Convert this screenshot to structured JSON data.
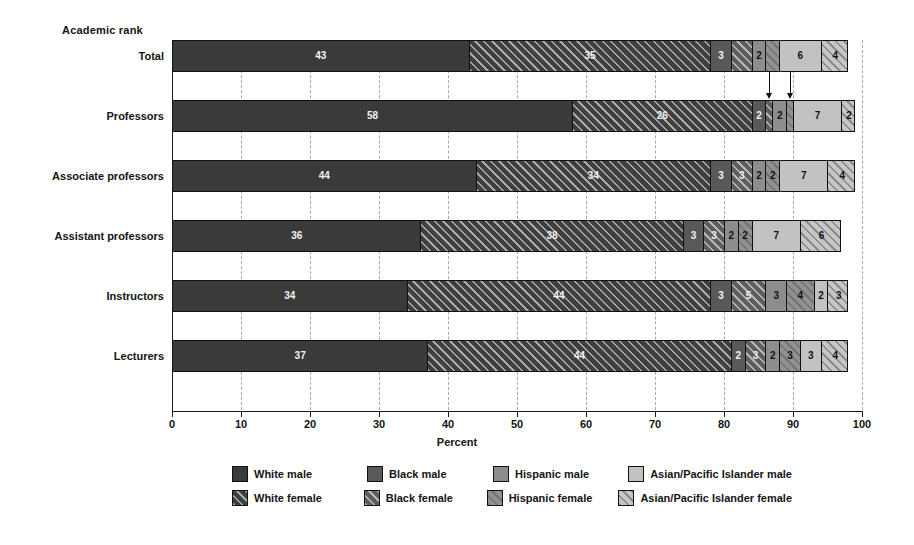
{
  "chart_data": {
    "type": "bar",
    "orientation": "horizontal",
    "stacked": true,
    "stacked_mode": "percent-segments",
    "title": "",
    "group_axis_title": "Academic rank",
    "xlabel": "Percent",
    "ylabel": "",
    "xlim": [
      0,
      100
    ],
    "xticks": [
      0,
      10,
      20,
      30,
      40,
      50,
      60,
      70,
      80,
      90,
      100
    ],
    "xtick_labels": [
      "0",
      "10",
      "20",
      "30",
      "40",
      "50",
      "60",
      "70",
      "80",
      "90",
      "100"
    ],
    "grid": "vertical-dashed",
    "legend_position": "bottom",
    "categories": [
      "Total",
      "Professors",
      "Associate professors",
      "Assistant professors",
      "Instructors",
      "Lecturers"
    ],
    "series": [
      {
        "name": "White male",
        "key": "white-male",
        "fill": "solid",
        "color": "#3a3a3a",
        "values": [
          43,
          58,
          44,
          36,
          34,
          37
        ]
      },
      {
        "name": "White female",
        "key": "white-female",
        "fill": "hatched",
        "color": "#3f3f3f",
        "values": [
          35,
          26,
          34,
          38,
          44,
          44
        ]
      },
      {
        "name": "Black male",
        "key": "black-male",
        "fill": "solid",
        "color": "#595959",
        "values": [
          3,
          2,
          3,
          3,
          3,
          2
        ]
      },
      {
        "name": "Black female",
        "key": "black-female",
        "fill": "hatched",
        "color": "#5e5e5e",
        "values": [
          3,
          1,
          3,
          3,
          5,
          3
        ]
      },
      {
        "name": "Hispanic male",
        "key": "hispanic-male",
        "fill": "solid",
        "color": "#8d8d8d",
        "values": [
          2,
          2,
          2,
          2,
          3,
          2
        ]
      },
      {
        "name": "Hispanic female",
        "key": "hispanic-female",
        "fill": "hatched",
        "color": "#919191",
        "values": [
          2,
          1,
          2,
          2,
          4,
          3
        ]
      },
      {
        "name": "Asian/Pacific Islander male",
        "key": "asian-male",
        "fill": "solid",
        "color": "#c2c2c2",
        "values": [
          6,
          7,
          7,
          7,
          2,
          3
        ]
      },
      {
        "name": "Asian/Pacific Islander female",
        "key": "asian-female",
        "fill": "hatched",
        "color": "#c6c6c6",
        "values": [
          4,
          2,
          4,
          6,
          3,
          4
        ]
      }
    ],
    "segment_labels": {
      "Total": [
        "43",
        "35",
        "3",
        "",
        "2",
        "",
        "6",
        "4"
      ],
      "Professors": [
        "58",
        "26",
        "2",
        "",
        "2",
        "",
        "7",
        "2"
      ],
      "Associate professors": [
        "44",
        "34",
        "3",
        "3",
        "2",
        "2",
        "7",
        "4"
      ],
      "Assistant professors": [
        "36",
        "38",
        "3",
        "3",
        "2",
        "2",
        "7",
        "6"
      ],
      "Instructors": [
        "34",
        "44",
        "3",
        "5",
        "3",
        "4",
        "2",
        "3"
      ],
      "Lecturers": [
        "37",
        "44",
        "2",
        "3",
        "2",
        "3",
        "3",
        "4"
      ]
    },
    "annotations": [
      {
        "type": "arrow",
        "target_row": "Professors",
        "target_series": "Black female",
        "note": "points to very small segment"
      },
      {
        "type": "arrow",
        "target_row": "Professors",
        "target_series": "Hispanic female",
        "note": "points to very small segment"
      }
    ]
  },
  "legend": {
    "rows": [
      [
        {
          "label": "White male",
          "key": "white-male",
          "fill": "solid"
        },
        {
          "label": "Black male",
          "key": "black-male",
          "fill": "solid"
        },
        {
          "label": "Hispanic male",
          "key": "hispanic-male",
          "fill": "solid"
        },
        {
          "label": "Asian/Pacific Islander male",
          "key": "asian-male",
          "fill": "solid"
        }
      ],
      [
        {
          "label": "White female",
          "key": "white-female",
          "fill": "hatched"
        },
        {
          "label": "Black female",
          "key": "black-female",
          "fill": "hatched"
        },
        {
          "label": "Hispanic female",
          "key": "hispanic-female",
          "fill": "hatched"
        },
        {
          "label": "Asian/Pacific Islander female",
          "key": "asian-female",
          "fill": "hatched"
        }
      ]
    ]
  }
}
